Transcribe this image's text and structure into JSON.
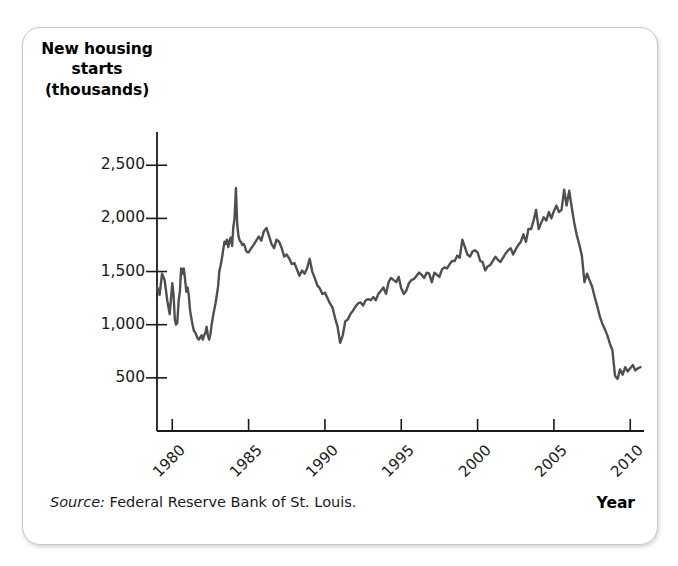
{
  "figure": {
    "y_axis_title_lines": [
      "New housing",
      "starts",
      "(thousands)"
    ],
    "x_axis_title": "Year",
    "source_label": "Source:",
    "source_text": " Federal Reserve Bank of St. Louis.",
    "line_color": "#4f4f4f",
    "axis_color": "#1a1a1a",
    "frame_color": "#c8c8c8"
  },
  "chart_data": {
    "type": "line",
    "title": "New housing starts (thousands)",
    "xlabel": "Year",
    "ylabel": "New housing starts (thousands)",
    "xlim": [
      1979.0,
      2010.9
    ],
    "ylim": [
      0,
      2700
    ],
    "xticks": [
      1980,
      1985,
      1990,
      1995,
      2000,
      2005,
      2010
    ],
    "xtick_labels": [
      "1980",
      "1985",
      "1990",
      "1995",
      "2000",
      "2005",
      "2010"
    ],
    "yticks": [
      500,
      1000,
      1500,
      2000,
      2500
    ],
    "ytick_labels": [
      "500",
      "1,000",
      "1,500",
      "2,000",
      "2,500"
    ],
    "grid": false,
    "legend": false,
    "source": "Federal Reserve Bank of St. Louis.",
    "series": [
      {
        "name": "New housing starts",
        "units": "thousands of units, annual rate",
        "x": [
          1979.0,
          1979.17,
          1979.33,
          1979.5,
          1979.67,
          1979.83,
          1980.0,
          1980.08,
          1980.17,
          1980.25,
          1980.33,
          1980.42,
          1980.5,
          1980.58,
          1980.67,
          1980.75,
          1980.83,
          1980.92,
          1981.0,
          1981.08,
          1981.17,
          1981.25,
          1981.33,
          1981.42,
          1981.5,
          1981.58,
          1981.67,
          1981.75,
          1981.83,
          1981.92,
          1982.0,
          1982.08,
          1982.17,
          1982.25,
          1982.33,
          1982.42,
          1982.5,
          1982.58,
          1982.67,
          1982.75,
          1982.83,
          1982.92,
          1983.0,
          1983.08,
          1983.17,
          1983.25,
          1983.33,
          1983.42,
          1983.5,
          1983.58,
          1983.67,
          1983.75,
          1983.83,
          1983.92,
          1984.0,
          1984.08,
          1984.17,
          1984.25,
          1984.33,
          1984.42,
          1984.5,
          1984.58,
          1984.67,
          1984.75,
          1984.83,
          1984.92,
          1985.0,
          1985.17,
          1985.33,
          1985.5,
          1985.67,
          1985.83,
          1986.0,
          1986.17,
          1986.33,
          1986.5,
          1986.67,
          1986.83,
          1987.0,
          1987.17,
          1987.33,
          1987.5,
          1987.67,
          1987.83,
          1988.0,
          1988.17,
          1988.33,
          1988.5,
          1988.67,
          1988.83,
          1989.0,
          1989.17,
          1989.33,
          1989.5,
          1989.67,
          1989.83,
          1990.0,
          1990.17,
          1990.33,
          1990.5,
          1990.67,
          1990.83,
          1991.0,
          1991.17,
          1991.33,
          1991.5,
          1991.67,
          1991.83,
          1992.0,
          1992.17,
          1992.33,
          1992.5,
          1992.67,
          1992.83,
          1993.0,
          1993.17,
          1993.33,
          1993.5,
          1993.67,
          1993.83,
          1994.0,
          1994.17,
          1994.33,
          1994.5,
          1994.67,
          1994.83,
          1995.0,
          1995.17,
          1995.33,
          1995.5,
          1995.67,
          1995.83,
          1996.0,
          1996.17,
          1996.33,
          1996.5,
          1996.67,
          1996.83,
          1997.0,
          1997.17,
          1997.33,
          1997.5,
          1997.67,
          1997.83,
          1998.0,
          1998.17,
          1998.33,
          1998.5,
          1998.67,
          1998.83,
          1999.0,
          1999.17,
          1999.33,
          1999.5,
          1999.67,
          1999.83,
          2000.0,
          2000.17,
          2000.33,
          2000.5,
          2000.67,
          2000.83,
          2001.0,
          2001.17,
          2001.33,
          2001.5,
          2001.67,
          2001.83,
          2002.0,
          2002.17,
          2002.33,
          2002.5,
          2002.67,
          2002.83,
          2003.0,
          2003.17,
          2003.33,
          2003.5,
          2003.67,
          2003.83,
          2004.0,
          2004.17,
          2004.33,
          2004.5,
          2004.67,
          2004.83,
          2005.0,
          2005.17,
          2005.33,
          2005.5,
          2005.67,
          2005.83,
          2006.0,
          2006.17,
          2006.33,
          2006.5,
          2006.67,
          2006.83,
          2007.0,
          2007.17,
          2007.33,
          2007.5,
          2007.67,
          2007.83,
          2008.0,
          2008.17,
          2008.33,
          2008.5,
          2008.67,
          2008.83,
          2009.0,
          2009.17,
          2009.33,
          2009.5,
          2009.67,
          2009.83,
          2010.0,
          2010.17,
          2010.33,
          2010.5,
          2010.67
        ],
        "y": [
          1360,
          1280,
          1480,
          1420,
          1230,
          1100,
          1390,
          1290,
          1050,
          1000,
          1020,
          1230,
          1310,
          1530,
          1480,
          1530,
          1440,
          1310,
          1350,
          1280,
          1130,
          1060,
          1000,
          940,
          930,
          900,
          870,
          860,
          880,
          900,
          860,
          900,
          920,
          980,
          900,
          860,
          910,
          1000,
          1080,
          1140,
          1200,
          1280,
          1360,
          1500,
          1560,
          1620,
          1700,
          1780,
          1760,
          1800,
          1730,
          1790,
          1820,
          1740,
          1920,
          2000,
          2286,
          1950,
          1840,
          1790,
          1780,
          1750,
          1760,
          1740,
          1700,
          1680,
          1680,
          1720,
          1750,
          1790,
          1830,
          1790,
          1880,
          1910,
          1840,
          1760,
          1720,
          1800,
          1780,
          1720,
          1640,
          1660,
          1620,
          1570,
          1580,
          1520,
          1460,
          1510,
          1480,
          1530,
          1620,
          1500,
          1440,
          1370,
          1340,
          1290,
          1300,
          1250,
          1200,
          1160,
          1060,
          980,
          830,
          900,
          1030,
          1050,
          1100,
          1130,
          1170,
          1200,
          1210,
          1180,
          1230,
          1240,
          1230,
          1260,
          1230,
          1290,
          1320,
          1350,
          1290,
          1400,
          1440,
          1420,
          1400,
          1450,
          1340,
          1290,
          1320,
          1390,
          1420,
          1430,
          1460,
          1490,
          1470,
          1440,
          1490,
          1480,
          1400,
          1490,
          1470,
          1450,
          1520,
          1540,
          1530,
          1570,
          1600,
          1600,
          1650,
          1630,
          1800,
          1730,
          1660,
          1640,
          1690,
          1700,
          1680,
          1600,
          1590,
          1510,
          1550,
          1560,
          1600,
          1640,
          1610,
          1590,
          1630,
          1670,
          1700,
          1720,
          1660,
          1710,
          1750,
          1780,
          1850,
          1780,
          1900,
          1900,
          1980,
          2080,
          1900,
          1960,
          2010,
          1980,
          2060,
          2000,
          2070,
          2120,
          2060,
          2080,
          2270,
          2120,
          2260,
          2100,
          1960,
          1840,
          1750,
          1650,
          1400,
          1480,
          1420,
          1360,
          1260,
          1180,
          1080,
          1010,
          960,
          900,
          820,
          760,
          520,
          490,
          580,
          530,
          600,
          560,
          590,
          620,
          570,
          590,
          600
        ]
      }
    ]
  }
}
